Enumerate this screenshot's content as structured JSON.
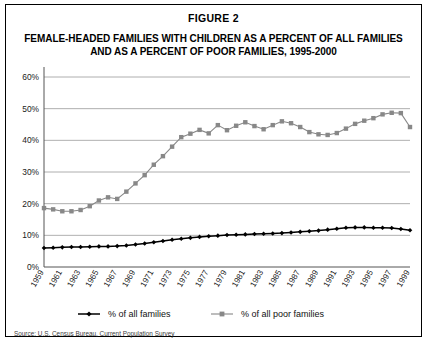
{
  "figure": {
    "number_label": "FIGURE 2",
    "title": "FEMALE-HEADED FAMILIES WITH CHILDREN AS A PERCENT OF ALL FAMILIES AND AS A PERCENT OF POOR FAMILIES, 1995-2000",
    "source_note": "Source: U.S. Census Bureau, Current Population Survey"
  },
  "chart_data": {
    "type": "line",
    "title": "FEMALE-HEADED FAMILIES WITH CHILDREN AS A PERCENT OF ALL FAMILIES AND AS A PERCENT OF POOR FAMILIES, 1995-2000",
    "xlabel": "",
    "ylabel": "",
    "ylim": [
      0,
      60
    ],
    "yticks": [
      0,
      10,
      20,
      30,
      40,
      50,
      60
    ],
    "ytick_labels": [
      "0%",
      "10%",
      "20%",
      "30%",
      "40%",
      "50%",
      "60%"
    ],
    "grid": true,
    "legend_position": "bottom",
    "x": [
      1959,
      1960,
      1961,
      1962,
      1963,
      1964,
      1965,
      1966,
      1967,
      1968,
      1969,
      1970,
      1971,
      1972,
      1973,
      1974,
      1975,
      1976,
      1977,
      1978,
      1979,
      1980,
      1981,
      1982,
      1983,
      1984,
      1985,
      1986,
      1987,
      1988,
      1989,
      1990,
      1991,
      1992,
      1993,
      1994,
      1995,
      1996,
      1997,
      1998,
      1999
    ],
    "xtick_labels": [
      "1959",
      "1961",
      "1963",
      "1965",
      "1967",
      "1969",
      "1971",
      "1973",
      "1975",
      "1977",
      "1979",
      "1981",
      "1983",
      "1985",
      "1987",
      "1989",
      "1991",
      "1993",
      "1995",
      "1997",
      "1999"
    ],
    "series": [
      {
        "name": "% of all families",
        "color": "#000000",
        "marker": "diamond",
        "values": [
          6.0,
          6.1,
          6.2,
          6.3,
          6.3,
          6.4,
          6.5,
          6.5,
          6.6,
          6.8,
          7.1,
          7.4,
          7.8,
          8.2,
          8.6,
          8.9,
          9.2,
          9.5,
          9.7,
          9.9,
          10.1,
          10.2,
          10.3,
          10.4,
          10.5,
          10.6,
          10.7,
          10.9,
          11.1,
          11.3,
          11.5,
          11.8,
          12.1,
          12.4,
          12.5,
          12.5,
          12.4,
          12.4,
          12.3,
          12.0,
          11.6
        ]
      },
      {
        "name": "% of all poor families",
        "color": "#888888",
        "marker": "square",
        "values": [
          18.6,
          18.2,
          17.6,
          17.6,
          18.0,
          19.2,
          21.0,
          22.0,
          21.5,
          23.8,
          26.4,
          29.0,
          32.3,
          35.0,
          38.0,
          41.0,
          42.1,
          43.3,
          42.2,
          44.8,
          43.2,
          44.6,
          45.7,
          44.5,
          43.5,
          44.8,
          46.0,
          45.4,
          44.2,
          42.6,
          41.9,
          41.7,
          42.3,
          43.7,
          45.2,
          46.2,
          47.0,
          48.2,
          48.7,
          48.6,
          44.2
        ]
      }
    ]
  }
}
